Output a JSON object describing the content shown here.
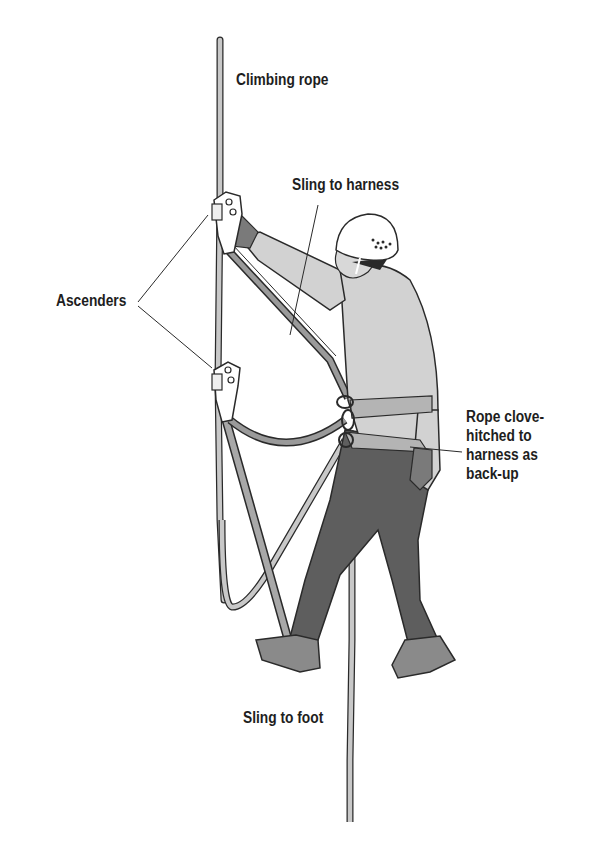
{
  "diagram": {
    "labels": {
      "climbing_rope": "Climbing rope",
      "sling_to_harness": "Sling to harness",
      "ascenders": "Ascenders",
      "rope_clove_hitched": "Rope clove-\nhitched to\nharness as\nback-up",
      "sling_to_foot": "Sling to foot"
    },
    "colors": {
      "outline": "#2a2a2a",
      "rope": "#c8c8c8",
      "shirt": "#d2d2d2",
      "pants": "#5e5e5e",
      "gloves": "#7a7a7a",
      "boots": "#8a8a8a",
      "helmet": "#ffffff",
      "harness": "#b4b4b4",
      "sling": "#9a9a9a",
      "text": "#1e1e1e"
    }
  }
}
